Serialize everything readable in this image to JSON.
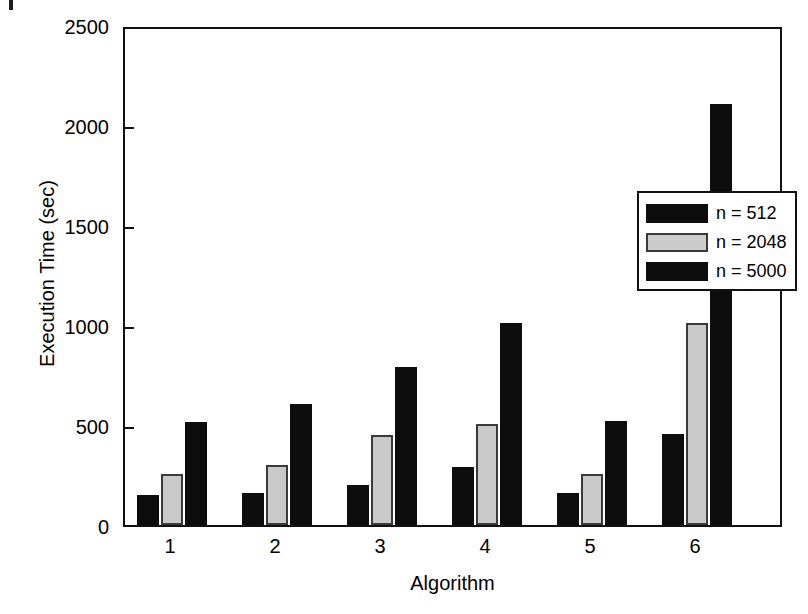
{
  "chart_data": {
    "type": "bar",
    "title": "",
    "xlabel": "Algorithm",
    "ylabel": "Execution Time (sec)",
    "categories": [
      "1",
      "2",
      "3",
      "4",
      "5",
      "6"
    ],
    "ylim": [
      0,
      2500
    ],
    "yticks": [
      0,
      500,
      1000,
      1500,
      2000,
      2500
    ],
    "ytick_labels": [
      "0",
      "500",
      "1000",
      "1500",
      "2000",
      "2500"
    ],
    "grid": false,
    "legend_position": "upper right inside",
    "series": [
      {
        "name": "n = 512",
        "color": "#0d0d0d",
        "values": [
          150,
          160,
          200,
          290,
          160,
          455
        ]
      },
      {
        "name": "n = 2048",
        "color": "#c9c9c9",
        "values": [
          255,
          300,
          450,
          505,
          255,
          1010
        ]
      },
      {
        "name": "n = 5000",
        "color": "#0d0d0d",
        "values": [
          515,
          605,
          790,
          1010,
          520,
          2105
        ]
      }
    ]
  },
  "axes": {
    "y_title": "Execution Time (sec)",
    "x_title": "Algorithm",
    "y_tick_labels": [
      "2500",
      "2000",
      "1500",
      "1000",
      "500",
      "0"
    ],
    "x_tick_labels": [
      "1",
      "2",
      "3",
      "4",
      "5",
      "6"
    ]
  },
  "legend": {
    "entries": [
      {
        "label": "n = 512",
        "swatch": "black"
      },
      {
        "label": "n = 2048",
        "swatch": "gray"
      },
      {
        "label": "n = 5000",
        "swatch": "black"
      }
    ]
  }
}
